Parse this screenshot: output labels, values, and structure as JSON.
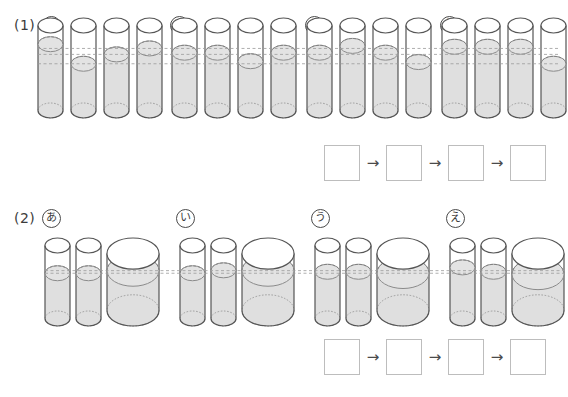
{
  "page": {
    "width": 568,
    "height": 397,
    "background": "#ffffff"
  },
  "style": {
    "outline_color": "#555555",
    "water_fill": "#d9d9d9",
    "water_surface": "#e3e3e3",
    "glass_fill": "#ffffff",
    "dash_color": "#9a9a9a",
    "box_border": "#bdbdbd",
    "text_color": "#3c3c3c"
  },
  "sections": [
    {
      "id": "section-1",
      "number_label": "(1)",
      "groups": [
        {
          "id": "g1a",
          "label": "あ",
          "label_icon": "circled-hiragana-a",
          "cylinder_kind": "narrow-equal",
          "cylinders": [
            {
              "index": 1,
              "width_units": 1,
              "fill_level_pct": 78
            },
            {
              "index": 2,
              "width_units": 1,
              "fill_level_pct": 55
            },
            {
              "index": 3,
              "width_units": 1,
              "fill_level_pct": 66
            },
            {
              "index": 4,
              "width_units": 1,
              "fill_level_pct": 73
            }
          ]
        },
        {
          "id": "g1i",
          "label": "い",
          "label_icon": "circled-hiragana-i",
          "cylinder_kind": "narrow-equal",
          "cylinders": [
            {
              "index": 1,
              "width_units": 1,
              "fill_level_pct": 68
            },
            {
              "index": 2,
              "width_units": 1,
              "fill_level_pct": 68
            },
            {
              "index": 3,
              "width_units": 1,
              "fill_level_pct": 58
            },
            {
              "index": 4,
              "width_units": 1,
              "fill_level_pct": 68
            }
          ]
        },
        {
          "id": "g1u",
          "label": "う",
          "label_icon": "circled-hiragana-u",
          "cylinder_kind": "narrow-equal",
          "cylinders": [
            {
              "index": 1,
              "width_units": 1,
              "fill_level_pct": 68
            },
            {
              "index": 2,
              "width_units": 1,
              "fill_level_pct": 76
            },
            {
              "index": 3,
              "width_units": 1,
              "fill_level_pct": 68
            },
            {
              "index": 4,
              "width_units": 1,
              "fill_level_pct": 57
            }
          ]
        },
        {
          "id": "g1e",
          "label": "え",
          "label_icon": "circled-hiragana-e",
          "cylinder_kind": "narrow-equal",
          "cylinders": [
            {
              "index": 1,
              "width_units": 1,
              "fill_level_pct": 75
            },
            {
              "index": 2,
              "width_units": 1,
              "fill_level_pct": 75
            },
            {
              "index": 3,
              "width_units": 1,
              "fill_level_pct": 75
            },
            {
              "index": 4,
              "width_units": 1,
              "fill_level_pct": 55
            }
          ]
        }
      ],
      "answer_boxes": [
        "",
        "",
        "",
        ""
      ],
      "answer_arrows": [
        "→",
        "→",
        "→"
      ]
    },
    {
      "id": "section-2",
      "number_label": "(2)",
      "groups": [
        {
          "id": "g2a",
          "label": "あ",
          "label_icon": "circled-hiragana-a",
          "cylinder_kind": "two-narrow-one-wide",
          "cylinders": [
            {
              "index": 1,
              "width_units": 1,
              "fill_level_pct": 62
            },
            {
              "index": 2,
              "width_units": 1,
              "fill_level_pct": 62
            },
            {
              "index": 3,
              "width_units": 2,
              "fill_level_pct": 70
            }
          ]
        },
        {
          "id": "g2i",
          "label": "い",
          "label_icon": "circled-hiragana-i",
          "cylinder_kind": "two-narrow-one-wide",
          "cylinders": [
            {
              "index": 1,
              "width_units": 1,
              "fill_level_pct": 62
            },
            {
              "index": 2,
              "width_units": 1,
              "fill_level_pct": 66
            },
            {
              "index": 3,
              "width_units": 2,
              "fill_level_pct": 70
            }
          ]
        },
        {
          "id": "g2u",
          "label": "う",
          "label_icon": "circled-hiragana-u",
          "cylinder_kind": "two-narrow-one-wide",
          "cylinders": [
            {
              "index": 1,
              "width_units": 1,
              "fill_level_pct": 64
            },
            {
              "index": 2,
              "width_units": 1,
              "fill_level_pct": 64
            },
            {
              "index": 3,
              "width_units": 2,
              "fill_level_pct": 66
            }
          ]
        },
        {
          "id": "g2e",
          "label": "え",
          "label_icon": "circled-hiragana-e",
          "cylinder_kind": "two-narrow-one-wide",
          "cylinders": [
            {
              "index": 1,
              "width_units": 1,
              "fill_level_pct": 70
            },
            {
              "index": 2,
              "width_units": 1,
              "fill_level_pct": 64
            },
            {
              "index": 3,
              "width_units": 2,
              "fill_level_pct": 64
            }
          ]
        }
      ],
      "answer_boxes": [
        "",
        "",
        "",
        ""
      ],
      "answer_arrows": [
        "→",
        "→",
        "→"
      ]
    }
  ]
}
